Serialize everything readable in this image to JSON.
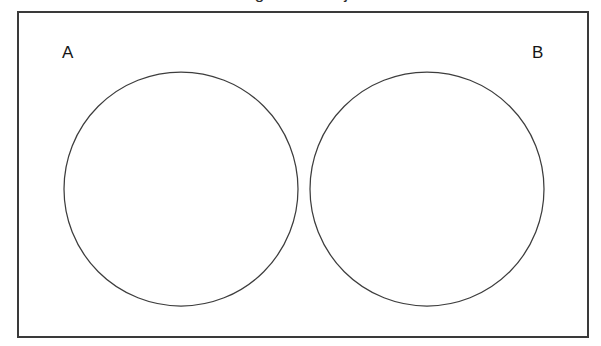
{
  "figure": {
    "kind": "venn-diagram",
    "title_fragment": "Venn diagram of disjoint sets",
    "background_color": "#ffffff",
    "rect_stroke_color": "#3a3a3a",
    "circle_stroke_color": "#3d3d3d",
    "label_color": "#151515"
  },
  "universal_set": {
    "name": "universal-set-rectangle",
    "x": 18,
    "y": 12,
    "width": 570,
    "height": 325
  },
  "sets": [
    {
      "label": "A",
      "name": "set-a",
      "cx": 181,
      "cy": 189,
      "rx": 117,
      "ry": 117,
      "label_x": 62,
      "label_y": 58
    },
    {
      "label": "B",
      "name": "set-b",
      "cx": 427,
      "cy": 189,
      "rx": 117,
      "ry": 117,
      "label_x": 532,
      "label_y": 58
    }
  ],
  "chart_data": {
    "type": "diagram",
    "diagram_type": "venn",
    "title": "Venn diagram of disjoint sets",
    "sets": [
      "A",
      "B"
    ],
    "regions": [
      {
        "region": "A only",
        "present": true
      },
      {
        "region": "B only",
        "present": true
      },
      {
        "region": "A ∩ B",
        "present": false
      },
      {
        "region": "outside A and B (universal set)",
        "present": true
      }
    ],
    "relationship": "disjoint",
    "intersection": "empty",
    "shaded_regions": [],
    "fill": "none",
    "legend": "none",
    "labels": [
      "A",
      "B"
    ]
  }
}
